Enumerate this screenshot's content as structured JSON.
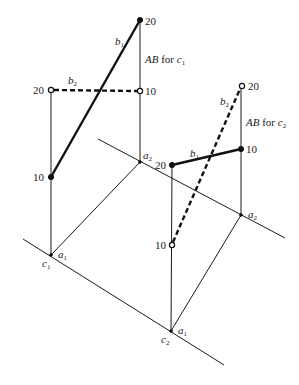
{
  "diagram": {
    "left_view": {
      "ab_label": "AB for ",
      "ab_var": "c",
      "ab_sub": "1",
      "line_b1": {
        "var": "b",
        "sub": "1"
      },
      "line_b2": {
        "var": "b",
        "sub": "2"
      },
      "point_labels": {
        "b1_top": "20",
        "b2_left": "20",
        "b2_right": "10",
        "b1_bottom": "10"
      },
      "base_labels": {
        "c": "c",
        "c_sub": "1",
        "a_low": "a",
        "a_low_sub": "1",
        "a_high": "a",
        "a_high_sub": "2"
      }
    },
    "right_view": {
      "ab_label": "AB for ",
      "ab_var": "c",
      "ab_sub": "2",
      "line_b1": {
        "var": "b",
        "sub": "1"
      },
      "line_b2": {
        "var": "b",
        "sub": "2"
      },
      "point_labels": {
        "b2_top": "20",
        "b1_right": "10",
        "b1_left": "20",
        "b2_bottom": "10"
      },
      "base_labels": {
        "c": "c",
        "c_sub": "2",
        "a_low": "a",
        "a_low_sub": "1",
        "a_high": "a",
        "a_high_sub": "2"
      }
    }
  }
}
